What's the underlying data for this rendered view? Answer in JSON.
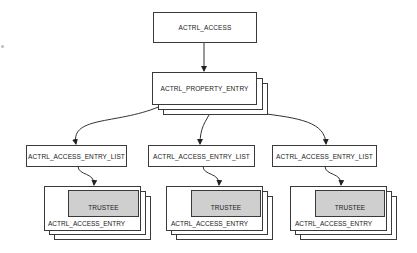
{
  "diagram": {
    "root": {
      "label": "ACTRL_ACCESS"
    },
    "property_entry": {
      "label": "ACTRL_PROPERTY_ENTRY",
      "stacked": true
    },
    "entry_lists": [
      {
        "label": "ACTRL_ACCESS_ENTRY_LIST"
      },
      {
        "label": "ACTRL_ACCESS_ENTRY_LIST"
      },
      {
        "label": "ACTRL_ACCESS_ENTRY_LIST"
      }
    ],
    "entries": [
      {
        "label": "ACTRL_ACCESS_ENTRY",
        "trustee": "TRUSTEE"
      },
      {
        "label": "ACTRL_ACCESS_ENTRY",
        "trustee": "TRUSTEE"
      },
      {
        "label": "ACTRL_ACCESS_ENTRY",
        "trustee": "TRUSTEE"
      }
    ],
    "colors": {
      "line": "#3a3a3a",
      "trustee_fill": "#cfcfcf",
      "background": "#ffffff"
    }
  }
}
